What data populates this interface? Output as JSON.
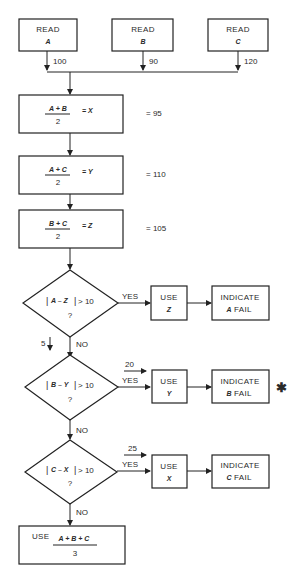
{
  "read_boxes": [
    {
      "label": "READ",
      "var": "A",
      "value": "100"
    },
    {
      "label": "READ",
      "var": "B",
      "value": "90"
    },
    {
      "label": "READ",
      "var": "C",
      "value": "120"
    }
  ],
  "compute_boxes": [
    {
      "numerator": "A + B",
      "denominator": "2",
      "result_var": "= X",
      "result_value": "= 95"
    },
    {
      "numerator": "A + C",
      "denominator": "2",
      "result_var": "= Y",
      "result_value": "= 110"
    },
    {
      "numerator": "B + C",
      "denominator": "2",
      "result_var": "= Z",
      "result_value": "= 105"
    }
  ],
  "decisions": [
    {
      "left": "|",
      "expr": "A – Z",
      "right": "|",
      "comparison": "> 10",
      "question": "?",
      "yes": "YES",
      "no": "NO",
      "yes_annotation": "",
      "no_annotation": "5",
      "use_label": "USE",
      "use_var": "Z",
      "indicate_label": "INDICATE",
      "fail_var": "A",
      "fail_label": "FAIL",
      "marker": ""
    },
    {
      "left": "|",
      "expr": "B – Y",
      "right": "|",
      "comparison": "> 10",
      "question": "?",
      "yes": "YES",
      "no": "NO",
      "yes_annotation": "20",
      "no_annotation": "",
      "use_label": "USE",
      "use_var": "Y",
      "indicate_label": "INDICATE",
      "fail_var": "B",
      "fail_label": "FAIL",
      "marker": "✱"
    },
    {
      "left": "|",
      "expr": "C – X",
      "right": "|",
      "comparison": "> 10",
      "question": "?",
      "yes": "YES",
      "no": "NO",
      "yes_annotation": "25",
      "no_annotation": "",
      "use_label": "USE",
      "use_var": "X",
      "indicate_label": "INDICATE",
      "fail_var": "C",
      "fail_label": "FAIL",
      "marker": ""
    }
  ],
  "final_box": {
    "label": "USE",
    "numerator": "A + B + C",
    "denominator": "3"
  }
}
